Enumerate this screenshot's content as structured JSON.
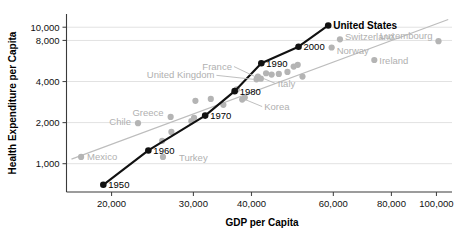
{
  "chart_data": {
    "type": "scatter",
    "title": "",
    "xlabel": "GDP per Capita",
    "ylabel": "Health Expenditure per Capita",
    "xscale": "log",
    "yscale": "log",
    "xlim": [
      16000,
      108000
    ],
    "ylim": [
      620,
      12500
    ],
    "xticks": [
      20000,
      30000,
      40000,
      60000,
      80000,
      100000
    ],
    "xticklabels": [
      "20,000",
      "30,000",
      "40,000",
      "60,000",
      "80,000",
      "100,000"
    ],
    "yticks": [
      1000,
      2000,
      4000,
      8000,
      10000
    ],
    "yticklabels": [
      "1,000",
      "2,000",
      "4,000",
      "8,000",
      "10,000"
    ],
    "grid": true,
    "legend": "none",
    "series": [
      {
        "name": "United States",
        "color": "#111111",
        "type": "line-with-markers",
        "end_label": "United States",
        "points": [
          {
            "label": "1950",
            "x": 19200,
            "y": 700
          },
          {
            "label": "1960",
            "x": 24000,
            "y": 1250
          },
          {
            "label": "1970",
            "x": 31800,
            "y": 2250
          },
          {
            "label": "1980",
            "x": 36800,
            "y": 3400
          },
          {
            "label": "1990",
            "x": 42000,
            "y": 5450
          },
          {
            "label": "2000",
            "x": 50500,
            "y": 7200
          },
          {
            "label": "",
            "x": 58500,
            "y": 10300
          }
        ]
      },
      {
        "name": "Other OECD countries",
        "color": "#b4b4b4",
        "type": "scatter",
        "points": [
          {
            "label": "Mexico",
            "x": 17200,
            "y": 1120
          },
          {
            "label": "Chile",
            "x": 22800,
            "y": 1980
          },
          {
            "label": "Turkey",
            "x": 25800,
            "y": 1120
          },
          {
            "label": "",
            "x": 25700,
            "y": 1470
          },
          {
            "label": "",
            "x": 26900,
            "y": 1710
          },
          {
            "label": "Greece",
            "x": 26800,
            "y": 2200
          },
          {
            "label": "",
            "x": 29700,
            "y": 2050
          },
          {
            "label": "",
            "x": 30100,
            "y": 2170
          },
          {
            "label": "",
            "x": 30300,
            "y": 2890
          },
          {
            "label": "",
            "x": 32700,
            "y": 2980
          },
          {
            "label": "",
            "x": 34800,
            "y": 2700
          },
          {
            "label": "",
            "x": 37200,
            "y": 3500
          },
          {
            "label": "Korea",
            "x": 38200,
            "y": 2950
          },
          {
            "label": "",
            "x": 38700,
            "y": 3050
          },
          {
            "label": "United Kingdom",
            "x": 41000,
            "y": 4150
          },
          {
            "label": "France",
            "x": 41300,
            "y": 4350
          },
          {
            "label": "Italy",
            "x": 41900,
            "y": 4200
          },
          {
            "label": "",
            "x": 43000,
            "y": 4600
          },
          {
            "label": "",
            "x": 44200,
            "y": 4500
          },
          {
            "label": "",
            "x": 45800,
            "y": 4550
          },
          {
            "label": "",
            "x": 47800,
            "y": 4700
          },
          {
            "label": "",
            "x": 49300,
            "y": 5150
          },
          {
            "label": "",
            "x": 50300,
            "y": 5300
          },
          {
            "label": "",
            "x": 51500,
            "y": 4350
          },
          {
            "label": "Norway",
            "x": 59500,
            "y": 7100
          },
          {
            "label": "Switzerland",
            "x": 62000,
            "y": 8150
          },
          {
            "label": "Ireland",
            "x": 73500,
            "y": 5750
          },
          {
            "label": "Luxembourg",
            "x": 101000,
            "y": 7900
          }
        ]
      },
      {
        "name": "Trend line",
        "color": "#bdbdbd",
        "type": "line",
        "points": [
          {
            "x": 16400,
            "y": 1080
          },
          {
            "x": 106000,
            "y": 11400
          }
        ]
      }
    ],
    "annotations": [
      {
        "text": "United States",
        "style": "bold-black"
      },
      {
        "text": "1950",
        "style": "black"
      },
      {
        "text": "1960",
        "style": "black"
      },
      {
        "text": "1970",
        "style": "black"
      },
      {
        "text": "1980",
        "style": "black"
      },
      {
        "text": "1990",
        "style": "black"
      },
      {
        "text": "2000",
        "style": "black"
      },
      {
        "text": "Mexico",
        "style": "gray"
      },
      {
        "text": "Chile",
        "style": "gray"
      },
      {
        "text": "Turkey",
        "style": "gray"
      },
      {
        "text": "Greece",
        "style": "gray"
      },
      {
        "text": "Korea",
        "style": "gray"
      },
      {
        "text": "United Kingdom",
        "style": "gray"
      },
      {
        "text": "France",
        "style": "gray"
      },
      {
        "text": "Italy",
        "style": "gray"
      },
      {
        "text": "Norway",
        "style": "gray"
      },
      {
        "text": "Switzerland",
        "style": "gray"
      },
      {
        "text": "Ireland",
        "style": "gray"
      },
      {
        "text": "Luxembourg",
        "style": "gray"
      }
    ],
    "colors": {
      "highlight": "#111111",
      "other": "#b4b4b4",
      "grid": "#e2e2e2",
      "axis": "#3a3a3a",
      "background": "#ffffff"
    }
  }
}
